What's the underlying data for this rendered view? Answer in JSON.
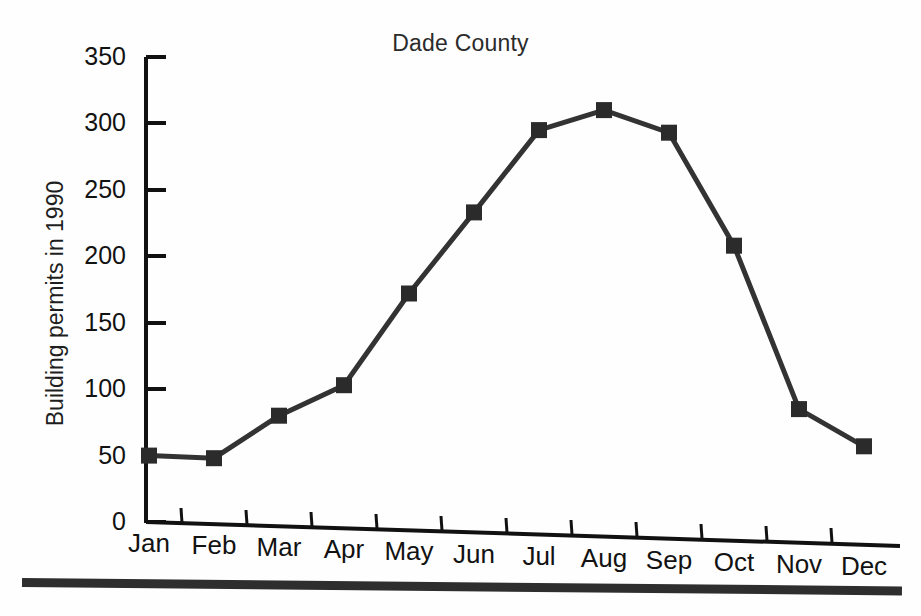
{
  "figure": {
    "title": "Dade County",
    "ylabel": "Building permits in 1990",
    "line_color": "#333333",
    "marker_color": "#2b2b2b",
    "axis_color": "#111111",
    "background": "#fefefe"
  },
  "chart_data": {
    "type": "line",
    "title": "Dade County",
    "xlabel": "",
    "ylabel": "Building permits in 1990",
    "categories": [
      "Jan",
      "Feb",
      "Mar",
      "Apr",
      "May",
      "Jun",
      "Jul",
      "Aug",
      "Sep",
      "Oct",
      "Nov",
      "Dec"
    ],
    "values": [
      50,
      48,
      80,
      103,
      172,
      233,
      295,
      310,
      293,
      208,
      85,
      57
    ],
    "ylim": [
      0,
      350
    ],
    "yticks": [
      0,
      50,
      100,
      150,
      200,
      250,
      300,
      350
    ],
    "ytick_labels": [
      "0",
      "50",
      "100",
      "150",
      "200",
      "250",
      "300",
      "350"
    ],
    "grid": false,
    "legend": false,
    "marker": "square",
    "series": [
      {
        "name": "Building permits",
        "values": [
          50,
          48,
          80,
          103,
          172,
          233,
          295,
          310,
          293,
          208,
          85,
          57
        ]
      }
    ]
  }
}
